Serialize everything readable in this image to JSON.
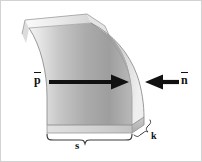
{
  "figure": {
    "background_color": "#ffffff",
    "border_color": "#d2d2d2",
    "shell": {
      "fill_light": "#f2f2f2",
      "fill_mid": "#c9c9c9",
      "fill_dark": "#9a9a9a",
      "edge_color": "#8c8c8c",
      "top_face_color": "#ededed",
      "right_face_color": "#b8b8b8"
    },
    "arrows": {
      "color": "#111111",
      "pressure_arrow_direction": "right",
      "normal_arrow_direction": "left"
    },
    "labels": {
      "pressure": {
        "text": "p",
        "overbar": true,
        "name": "pressure-label"
      },
      "normal": {
        "text": "n",
        "overbar": true,
        "name": "normal-vector-label"
      },
      "span": {
        "text": "s",
        "overbar": false,
        "name": "span-dimension-label"
      },
      "thickness": {
        "text": "k",
        "overbar": false,
        "name": "thickness-dimension-label"
      }
    }
  }
}
